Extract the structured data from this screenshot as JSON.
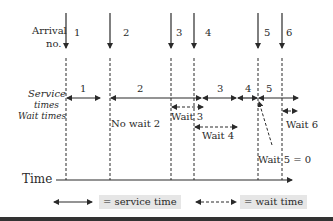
{
  "labels": {
    "arrival": "Arrival",
    "arrival_no": "no.",
    "service_times": "Service",
    "service_times_2": "times",
    "wait_times": "Wait times",
    "time_axis": "Time"
  },
  "arrivals": [
    {
      "num": "1",
      "x": 66
    },
    {
      "num": "2",
      "x": 110
    },
    {
      "num": "3",
      "x": 171
    },
    {
      "num": "4",
      "x": 194
    },
    {
      "num": "5",
      "x": 258
    },
    {
      "num": "6",
      "x": 282
    }
  ],
  "service": [
    {
      "label": "1",
      "x1": 66,
      "x2": 100
    },
    {
      "label": "2",
      "x1": 110,
      "x2": 202
    },
    {
      "label": "3",
      "x1": 203,
      "x2": 236
    },
    {
      "label": "4",
      "x1": 238,
      "x2": 257
    },
    {
      "label": "5",
      "x1": 259,
      "x2": 298
    }
  ],
  "waits": [
    {
      "label": "No wait 2"
    },
    {
      "label": "Wait 3"
    },
    {
      "label": "Wait 4"
    },
    {
      "label": "Wait 5 = 0"
    },
    {
      "label": "Wait 6"
    }
  ],
  "legend": {
    "service": "= service time",
    "wait": "= wait time"
  },
  "colors": {
    "line": "#2a2a2a",
    "legend_bg": "#e6e6e6",
    "bottom_bar": "#333333"
  }
}
